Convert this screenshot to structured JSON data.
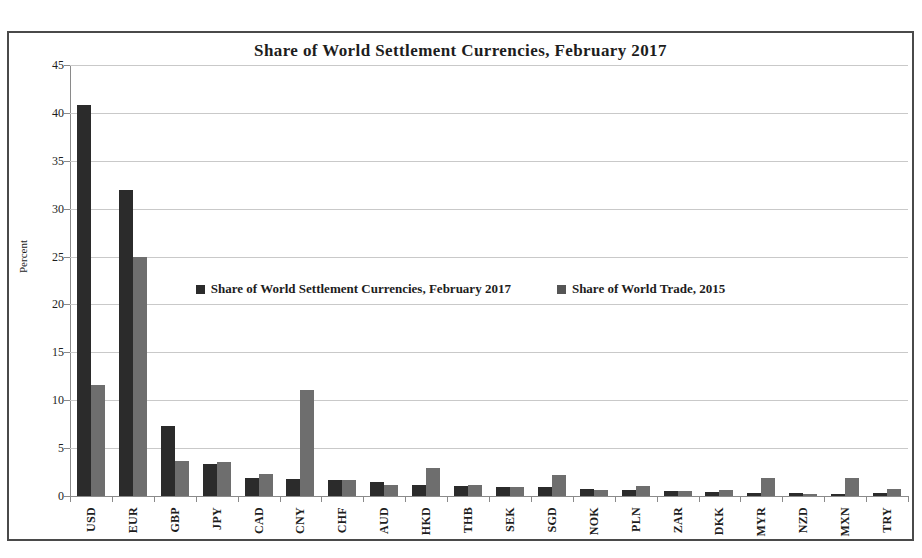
{
  "chart_data": {
    "type": "bar",
    "title": "Share of World Settlement Currencies,  February 2017",
    "xlabel": "",
    "ylabel": "Percent",
    "ylim": [
      0,
      45
    ],
    "yticks": [
      0,
      5,
      10,
      15,
      20,
      25,
      30,
      35,
      40,
      45
    ],
    "grid": true,
    "legend_position": "center-middle",
    "categories": [
      "USD",
      "EUR",
      "GBP",
      "JPY",
      "CAD",
      "CNY",
      "CHF",
      "AUD",
      "HKD",
      "THB",
      "SEK",
      "SGD",
      "NOK",
      "PLN",
      "ZAR",
      "DKK",
      "MYR",
      "NZD",
      "MXN",
      "TRY"
    ],
    "series": [
      {
        "name": "Share of World Settlement Currencies, February 2017",
        "color": "#2b2b2b",
        "values": [
          40.8,
          31.9,
          7.3,
          3.3,
          1.9,
          1.8,
          1.65,
          1.5,
          1.2,
          1.0,
          0.9,
          0.9,
          0.7,
          0.65,
          0.5,
          0.4,
          0.35,
          0.3,
          0.25,
          0.3
        ]
      },
      {
        "name": "Share of World Trade, 2015",
        "color": "#6e6e6e",
        "values": [
          11.6,
          25.0,
          3.7,
          3.6,
          2.3,
          11.1,
          1.7,
          1.2,
          2.9,
          1.1,
          0.95,
          2.2,
          0.6,
          1.0,
          0.5,
          0.6,
          1.85,
          0.25,
          1.85,
          0.75
        ]
      }
    ]
  },
  "legend": {
    "entries": [
      {
        "label": "Share of World Settlement Currencies, February 2017"
      },
      {
        "label": "Share of World Trade, 2015"
      }
    ]
  }
}
